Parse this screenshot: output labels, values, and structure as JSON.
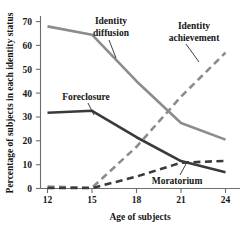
{
  "chart_data": {
    "type": "line",
    "title": "",
    "xlabel": "Age of subjects",
    "ylabel": "Percentage of subjects in each identity status",
    "x": [
      12,
      15,
      18,
      21,
      24
    ],
    "xlim": [
      11.4,
      24.8
    ],
    "ylim": [
      0,
      73
    ],
    "xticks": [
      "12",
      "15",
      "18",
      "21",
      "24"
    ],
    "yticks": [
      "0",
      "10",
      "20",
      "30",
      "40",
      "50",
      "60",
      "70"
    ],
    "ytick_values": [
      0,
      10,
      20,
      30,
      40,
      50,
      60,
      70
    ],
    "grid": false,
    "legend": "inline-annotations",
    "series": [
      {
        "name": "Identity diffusion",
        "values": [
          68,
          64.5,
          45,
          27.5,
          20.5
        ],
        "color": "#8c8c8c",
        "style": "solid",
        "width": 2.6
      },
      {
        "name": "Foreclosure",
        "values": [
          31.8,
          32.6,
          21.5,
          11.5,
          6.8
        ],
        "color": "#3a3a3a",
        "style": "solid",
        "width": 2.6
      },
      {
        "name": "Identity achievement",
        "values": [
          0.8,
          0.3,
          17.5,
          38.5,
          57
        ],
        "color": "#8c8c8c",
        "style": "dashed",
        "width": 2.6
      },
      {
        "name": "Moratorium",
        "values": [
          0.2,
          0.2,
          5.0,
          10.8,
          11.6
        ],
        "color": "#3a3a3a",
        "style": "dashed",
        "width": 2.6
      }
    ],
    "annotations": [
      {
        "label_line_1": "Identity",
        "label_line_2": "diffusion",
        "target_series": "Identity diffusion"
      },
      {
        "label_line_1": "Identity",
        "label_line_2": "achievement",
        "target_series": "Identity achievement"
      },
      {
        "label_line_1": "Foreclosure",
        "label_line_2": "",
        "target_series": "Foreclosure"
      },
      {
        "label_line_1": "Moratorium",
        "label_line_2": "",
        "target_series": "Moratorium"
      }
    ]
  },
  "axes": {
    "x_title": "Age of subjects",
    "y_title": "Percentage of subjects in each identity status",
    "x_tick_labels": [
      "12",
      "15",
      "18",
      "21",
      "24"
    ],
    "y_tick_labels": [
      "70",
      "60",
      "50",
      "40",
      "30",
      "20",
      "10",
      "0"
    ],
    "axis_color": "#6e6e6e"
  },
  "labels": {
    "identity_diffusion_l1": "Identity",
    "identity_diffusion_l2": "diffusion",
    "identity_achievement_l1": "Identity",
    "identity_achievement_l2": "achievement",
    "foreclosure": "Foreclosure",
    "moratorium": "Moratorium"
  },
  "colors": {
    "light_gray_series": "#8c8c8c",
    "dark_gray_series": "#3a3a3a",
    "axis": "#6e6e6e",
    "text": "#161616",
    "background": "#ffffff"
  }
}
